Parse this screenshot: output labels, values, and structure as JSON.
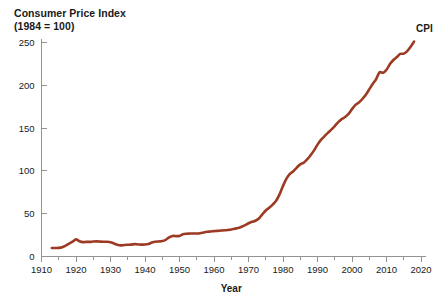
{
  "chart_data": {
    "type": "line",
    "title": "Consumer Price Index",
    "subtitle": "(1984 = 100)",
    "xlabel": "Year",
    "ylabel": "",
    "xlim": [
      1910,
      2020
    ],
    "ylim": [
      0,
      250
    ],
    "grid": false,
    "legend_position": "line-end",
    "line_color": "#9c3a24",
    "axis_color": "#939393",
    "xticks": [
      1910,
      1920,
      1930,
      1940,
      1950,
      1960,
      1970,
      1980,
      1990,
      2000,
      2010,
      2020
    ],
    "xtick_labels": [
      "1910",
      "1920",
      "1930",
      "1940",
      "1950",
      "1960",
      "1970",
      "1980",
      "1990",
      "2000",
      "2010",
      "2020"
    ],
    "xminor_ticks": [
      1915,
      1925,
      1935,
      1945,
      1955,
      1965,
      1975,
      1985,
      1995,
      2005,
      2015
    ],
    "yticks": [
      0,
      50,
      100,
      150,
      200,
      250
    ],
    "ytick_labels": [
      "0",
      "50",
      "100",
      "150",
      "200",
      "250"
    ],
    "series": [
      {
        "name": "CPI",
        "label": "CPI",
        "color": "#9c3a24",
        "x": [
          1913,
          1914,
          1915,
          1916,
          1917,
          1918,
          1919,
          1920,
          1921,
          1922,
          1923,
          1924,
          1925,
          1926,
          1927,
          1928,
          1929,
          1930,
          1931,
          1932,
          1933,
          1934,
          1935,
          1936,
          1937,
          1938,
          1939,
          1940,
          1941,
          1942,
          1943,
          1944,
          1945,
          1946,
          1947,
          1948,
          1949,
          1950,
          1951,
          1952,
          1953,
          1954,
          1955,
          1956,
          1957,
          1958,
          1959,
          1960,
          1961,
          1962,
          1963,
          1964,
          1965,
          1966,
          1967,
          1968,
          1969,
          1970,
          1971,
          1972,
          1973,
          1974,
          1975,
          1976,
          1977,
          1978,
          1979,
          1980,
          1981,
          1982,
          1983,
          1984,
          1985,
          1986,
          1987,
          1988,
          1989,
          1990,
          1991,
          1992,
          1993,
          1994,
          1995,
          1996,
          1997,
          1998,
          1999,
          2000,
          2001,
          2002,
          2003,
          2004,
          2005,
          2006,
          2007,
          2008,
          2009,
          2010,
          2011,
          2012,
          2013,
          2014,
          2015,
          2016,
          2017,
          2018
        ],
        "values": [
          9.9,
          10.0,
          10.1,
          10.9,
          12.8,
          15.1,
          17.3,
          20.0,
          17.9,
          16.8,
          17.1,
          17.1,
          17.5,
          17.7,
          17.4,
          17.2,
          17.2,
          16.7,
          15.2,
          13.7,
          13.0,
          13.4,
          13.7,
          13.9,
          14.4,
          14.1,
          13.9,
          14.0,
          14.7,
          16.3,
          17.3,
          17.6,
          18.0,
          19.5,
          22.3,
          24.0,
          23.8,
          24.1,
          26.0,
          26.6,
          26.8,
          26.9,
          26.8,
          27.2,
          28.1,
          28.9,
          29.2,
          29.6,
          29.9,
          30.3,
          30.6,
          31.0,
          31.5,
          32.5,
          33.4,
          34.8,
          36.7,
          38.8,
          40.5,
          41.8,
          44.4,
          49.3,
          53.8,
          56.9,
          60.6,
          65.2,
          72.6,
          82.4,
          90.9,
          96.5,
          99.6,
          103.9,
          107.6,
          109.6,
          113.6,
          118.3,
          124.0,
          130.7,
          136.2,
          140.3,
          144.5,
          148.2,
          152.4,
          156.9,
          160.5,
          163.0,
          166.6,
          172.2,
          177.1,
          179.9,
          184.0,
          188.9,
          195.3,
          201.6,
          207.3,
          215.3,
          214.5,
          218.1,
          224.9,
          229.6,
          233.0,
          236.7,
          237.0,
          240.0,
          245.1,
          251.1
        ]
      }
    ]
  }
}
